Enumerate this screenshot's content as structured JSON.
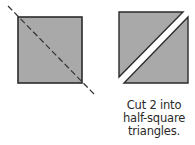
{
  "diagram": {
    "left_figure": {
      "shape": "square",
      "fill": "#a9a9a9",
      "stroke": "#2b2b2b",
      "cut_line": "dashed diagonal"
    },
    "right_figure": {
      "shapes": [
        "triangle",
        "triangle"
      ],
      "fill": "#a9a9a9",
      "stroke": "#2b2b2b"
    },
    "caption": {
      "line1": "Cut 2 into",
      "line2": "half-square",
      "line3": "triangles."
    }
  }
}
